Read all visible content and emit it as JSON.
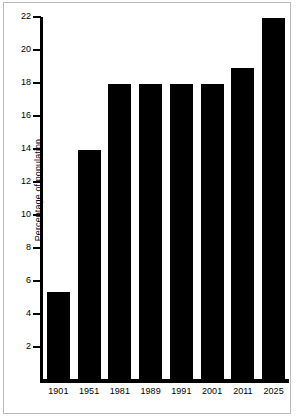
{
  "chart_data": {
    "type": "bar",
    "title": "",
    "xlabel": "",
    "ylabel": "Percentage of population",
    "categories": [
      "1901",
      "1951",
      "1981",
      "1989",
      "1991",
      "2001",
      "2011",
      "2025"
    ],
    "values": [
      5.4,
      14,
      18,
      18,
      18,
      18,
      19,
      22
    ],
    "ylim": [
      0,
      22
    ],
    "yticks": [
      2,
      4,
      6,
      8,
      10,
      12,
      14,
      16,
      18,
      20,
      22
    ],
    "ytick_labels": [
      "2",
      "4",
      "6",
      "8",
      "10",
      "12",
      "14",
      "16",
      "18",
      "20",
      "22"
    ],
    "grid": false,
    "legend": null,
    "bar_color": "#000000",
    "background_color": "#ffffff",
    "border_color": "#b9b9b9"
  }
}
